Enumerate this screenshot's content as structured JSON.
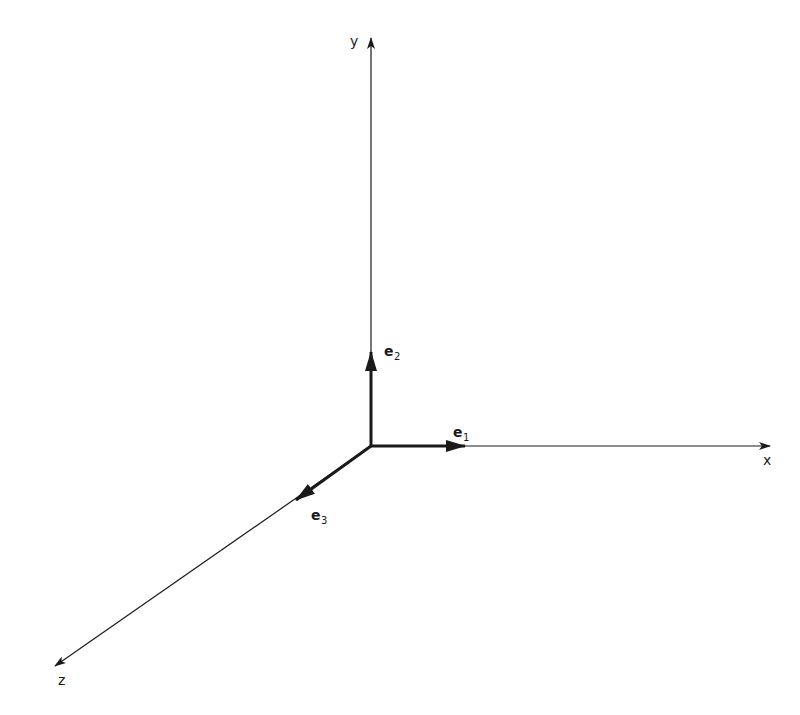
{
  "diagram": {
    "title": "",
    "origin": {
      "x": 371,
      "y": 446
    },
    "colors": {
      "stroke": "#1a1a1a",
      "background": "#ffffff"
    },
    "axes": [
      {
        "id": "x",
        "label": "x",
        "end": {
          "x": 770,
          "y": 446
        },
        "label_pos": {
          "x": 763,
          "y": 465
        }
      },
      {
        "id": "y",
        "label": "y",
        "end": {
          "x": 371,
          "y": 38
        },
        "label_pos": {
          "x": 350,
          "y": 46
        }
      },
      {
        "id": "z",
        "label": "z",
        "end": {
          "x": 55,
          "y": 666
        },
        "label_pos": {
          "x": 58,
          "y": 685
        }
      }
    ],
    "basis_vectors": [
      {
        "id": "e1",
        "base": "e",
        "sub": "1",
        "end": {
          "x": 465,
          "y": 446
        },
        "label_pos": {
          "x": 453,
          "y": 437
        }
      },
      {
        "id": "e2",
        "base": "e",
        "sub": "2",
        "end": {
          "x": 371,
          "y": 352
        },
        "label_pos": {
          "x": 384,
          "y": 356
        }
      },
      {
        "id": "e3",
        "base": "e",
        "sub": "3",
        "end": {
          "x": 296,
          "y": 500
        },
        "label_pos": {
          "x": 311,
          "y": 520
        }
      }
    ]
  }
}
